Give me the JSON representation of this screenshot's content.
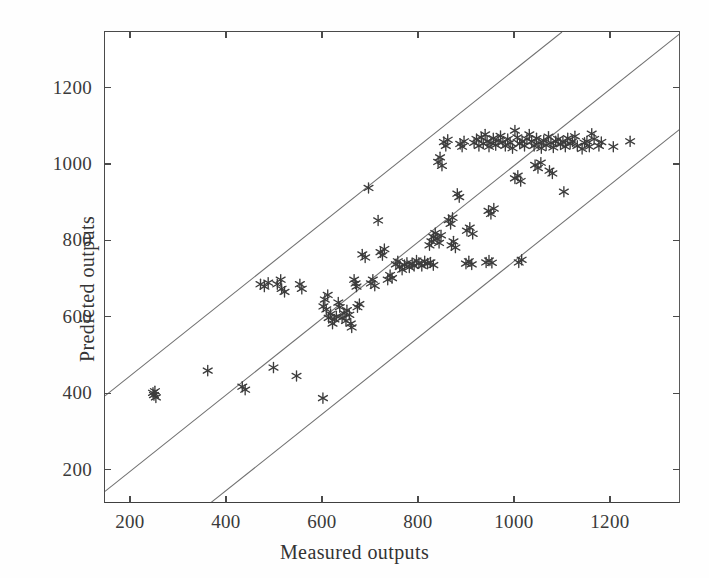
{
  "chart_data": {
    "type": "scatter",
    "title": "",
    "xlabel": "Measured outputs",
    "ylabel": "Predicted outputs",
    "xlim": [
      146,
      1346
    ],
    "ylim": [
      113,
      1348
    ],
    "xticks": [
      200,
      400,
      600,
      800,
      1000,
      1200
    ],
    "yticks": [
      200,
      400,
      600,
      800,
      1000,
      1200
    ],
    "xtick_labels": [
      "200",
      "400",
      "600",
      "800",
      "1000",
      "1200"
    ],
    "ytick_labels": [
      "200",
      "400",
      "600",
      "800",
      "1000",
      "1200"
    ],
    "grid": false,
    "legend": null,
    "marker": "asterisk-6-point",
    "marker_color": "#3c3c3c",
    "line_color": "#707070",
    "frame_color": "#4a4a4a",
    "reference_lines": [
      {
        "name": "upper-bound-line",
        "slope": 1,
        "intercept": 250,
        "style": "solid-thin"
      },
      {
        "name": "identity-line",
        "slope": 1,
        "intercept": 0,
        "style": "solid-thin"
      },
      {
        "name": "lower-bound-line",
        "slope": 1,
        "intercept": -250,
        "style": "solid-thin"
      }
    ],
    "points": [
      [
        246,
        404
      ],
      [
        248,
        398
      ],
      [
        250,
        408
      ],
      [
        252,
        392
      ],
      [
        360,
        462
      ],
      [
        432,
        420
      ],
      [
        438,
        412
      ],
      [
        470,
        688
      ],
      [
        478,
        682
      ],
      [
        486,
        692
      ],
      [
        497,
        470
      ],
      [
        505,
        688
      ],
      [
        512,
        700
      ],
      [
        514,
        676
      ],
      [
        520,
        668
      ],
      [
        545,
        448
      ],
      [
        552,
        688
      ],
      [
        556,
        676
      ],
      [
        600,
        390
      ],
      [
        601,
        630
      ],
      [
        604,
        648
      ],
      [
        607,
        622
      ],
      [
        610,
        660
      ],
      [
        612,
        600
      ],
      [
        616,
        610
      ],
      [
        620,
        585
      ],
      [
        624,
        596
      ],
      [
        628,
        604
      ],
      [
        632,
        640
      ],
      [
        635,
        628
      ],
      [
        640,
        600
      ],
      [
        644,
        612
      ],
      [
        648,
        592
      ],
      [
        650,
        620
      ],
      [
        655,
        608
      ],
      [
        658,
        585
      ],
      [
        660,
        575
      ],
      [
        665,
        700
      ],
      [
        668,
        690
      ],
      [
        670,
        682
      ],
      [
        672,
        628
      ],
      [
        676,
        636
      ],
      [
        682,
        766
      ],
      [
        688,
        758
      ],
      [
        695,
        940
      ],
      [
        700,
        690
      ],
      [
        704,
        700
      ],
      [
        708,
        684
      ],
      [
        715,
        855
      ],
      [
        720,
        772
      ],
      [
        724,
        764
      ],
      [
        728,
        780
      ],
      [
        735,
        700
      ],
      [
        740,
        712
      ],
      [
        744,
        704
      ],
      [
        752,
        740
      ],
      [
        756,
        748
      ],
      [
        760,
        734
      ],
      [
        765,
        726
      ],
      [
        770,
        738
      ],
      [
        775,
        744
      ],
      [
        780,
        732
      ],
      [
        786,
        742
      ],
      [
        790,
        736
      ],
      [
        795,
        750
      ],
      [
        800,
        744
      ],
      [
        806,
        736
      ],
      [
        812,
        748
      ],
      [
        818,
        742
      ],
      [
        824,
        745
      ],
      [
        830,
        738
      ],
      [
        822,
        790
      ],
      [
        826,
        800
      ],
      [
        830,
        812
      ],
      [
        834,
        822
      ],
      [
        838,
        806
      ],
      [
        842,
        796
      ],
      [
        846,
        816
      ],
      [
        840,
        1008
      ],
      [
        844,
        1020
      ],
      [
        848,
        998
      ],
      [
        852,
        1060
      ],
      [
        856,
        1050
      ],
      [
        860,
        1066
      ],
      [
        862,
        856
      ],
      [
        866,
        846
      ],
      [
        870,
        862
      ],
      [
        868,
        790
      ],
      [
        872,
        800
      ],
      [
        876,
        784
      ],
      [
        880,
        925
      ],
      [
        884,
        916
      ],
      [
        886,
        1055
      ],
      [
        890,
        1048
      ],
      [
        894,
        1062
      ],
      [
        898,
        742
      ],
      [
        904,
        748
      ],
      [
        910,
        740
      ],
      [
        900,
        828
      ],
      [
        906,
        836
      ],
      [
        912,
        820
      ],
      [
        915,
        1058
      ],
      [
        920,
        1068
      ],
      [
        925,
        1050
      ],
      [
        930,
        1072
      ],
      [
        934,
        1056
      ],
      [
        938,
        1080
      ],
      [
        942,
        1062
      ],
      [
        946,
        1048
      ],
      [
        950,
        1058
      ],
      [
        955,
        1070
      ],
      [
        960,
        1052
      ],
      [
        965,
        1064
      ],
      [
        945,
        880
      ],
      [
        950,
        872
      ],
      [
        956,
        886
      ],
      [
        940,
        745
      ],
      [
        946,
        750
      ],
      [
        952,
        744
      ],
      [
        970,
        1076
      ],
      [
        975,
        1060
      ],
      [
        980,
        1050
      ],
      [
        985,
        1068
      ],
      [
        990,
        1058
      ],
      [
        995,
        1044
      ],
      [
        1000,
        1090
      ],
      [
        1005,
        1072
      ],
      [
        1010,
        1056
      ],
      [
        1000,
        965
      ],
      [
        1006,
        972
      ],
      [
        1012,
        958
      ],
      [
        1015,
        1062
      ],
      [
        1020,
        1050
      ],
      [
        1025,
        1068
      ],
      [
        1008,
        745
      ],
      [
        1014,
        752
      ],
      [
        1030,
        1080
      ],
      [
        1035,
        1062
      ],
      [
        1040,
        1050
      ],
      [
        1045,
        1070
      ],
      [
        1050,
        1058
      ],
      [
        1055,
        1044
      ],
      [
        1042,
        1000
      ],
      [
        1048,
        992
      ],
      [
        1054,
        1006
      ],
      [
        1060,
        1064
      ],
      [
        1065,
        1052
      ],
      [
        1070,
        1074
      ],
      [
        1075,
        1058
      ],
      [
        1080,
        1046
      ],
      [
        1085,
        1062
      ],
      [
        1072,
        985
      ],
      [
        1078,
        978
      ],
      [
        1090,
        1068
      ],
      [
        1095,
        1054
      ],
      [
        1100,
        1060
      ],
      [
        1105,
        1048
      ],
      [
        1110,
        1070
      ],
      [
        1115,
        1056
      ],
      [
        1102,
        930
      ],
      [
        1120,
        1062
      ],
      [
        1125,
        1075
      ],
      [
        1130,
        1050
      ],
      [
        1140,
        1042
      ],
      [
        1145,
        1058
      ],
      [
        1150,
        1062
      ],
      [
        1155,
        1048
      ],
      [
        1160,
        1082
      ],
      [
        1165,
        1068
      ],
      [
        1175,
        1050
      ],
      [
        1180,
        1060
      ],
      [
        1205,
        1048
      ],
      [
        1240,
        1062
      ]
    ]
  },
  "axis": {
    "x_title": "Measured outputs",
    "y_title": "Predicted outputs"
  }
}
